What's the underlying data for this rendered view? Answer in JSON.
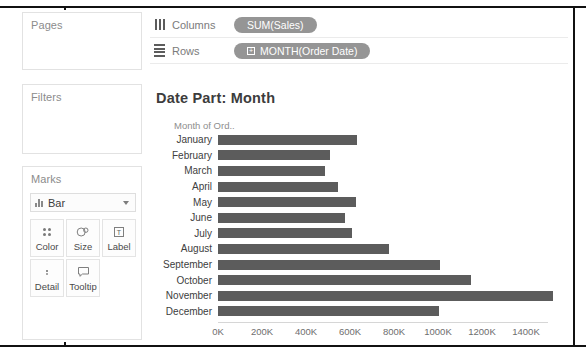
{
  "app": {
    "name": "tableau-worksheet"
  },
  "sidebar": {
    "pages": {
      "title": "Pages"
    },
    "filters": {
      "title": "Filters"
    },
    "marks": {
      "title": "Marks",
      "mark_type": "Bar",
      "mark_type_icon": "bar-chart-icon",
      "dropdown_icon": "chevron-down-icon",
      "buttons": [
        {
          "label": "Color",
          "icon": "color-dots-icon"
        },
        {
          "label": "Size",
          "icon": "size-circles-icon"
        },
        {
          "label": "Label",
          "icon": "label-text-icon"
        },
        {
          "label": "Detail",
          "icon": "detail-dots-icon"
        },
        {
          "label": "Tooltip",
          "icon": "tooltip-bubble-icon"
        }
      ]
    }
  },
  "shelves": {
    "columns": {
      "label": "Columns",
      "icon": "columns-icon",
      "pill": {
        "text": "SUM(Sales)",
        "has_expand": false
      }
    },
    "rows": {
      "label": "Rows",
      "icon": "rows-icon",
      "pill": {
        "text": "MONTH(Order Date)",
        "has_expand": true,
        "expand_glyph": "+"
      }
    }
  },
  "view": {
    "title": "Date Part: Month",
    "row_header_caption": "Month of Ord..",
    "colors": {
      "bar": "#5c5c5c",
      "pill": "#959595",
      "text": "#404040",
      "muted": "#8e8e8e"
    }
  },
  "chart_data": {
    "type": "bar",
    "orientation": "horizontal",
    "title": "Date Part: Month",
    "xlabel": "",
    "ylabel": "Month of Ord..",
    "categories": [
      "January",
      "February",
      "March",
      "April",
      "May",
      "June",
      "July",
      "August",
      "September",
      "October",
      "November",
      "December"
    ],
    "values": [
      630,
      509,
      485,
      546,
      625,
      579,
      607,
      779,
      1008,
      1148,
      1521,
      1003
    ],
    "value_unit": "K",
    "series": [
      {
        "name": "SUM(Sales)",
        "values": [
          630,
          509,
          485,
          546,
          625,
          579,
          607,
          779,
          1008,
          1148,
          1521,
          1003
        ]
      }
    ],
    "xlim": [
      0,
      1500
    ],
    "tick_values": [
      0,
      200,
      400,
      600,
      800,
      1000,
      1200,
      1400
    ],
    "tick_labels": [
      "0K",
      "200K",
      "400K",
      "600K",
      "800K",
      "1000K",
      "1200K",
      "1400K"
    ],
    "grid": false,
    "legend": null,
    "bar_color": "#5c5c5c"
  }
}
